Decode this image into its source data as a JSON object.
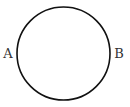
{
  "diagram": {
    "shape": "circle",
    "labels": {
      "left": "A",
      "right": "B"
    },
    "colors": {
      "stroke": "#111111",
      "label": "#333333",
      "background": "#ffffff"
    }
  }
}
